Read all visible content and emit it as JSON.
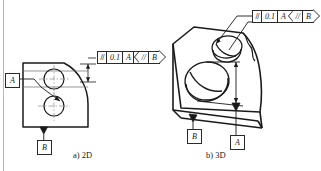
{
  "figure": {
    "ink_color": "#1a1a1a",
    "paper_color": "#ffffff",
    "border_color": "#b8b8b8"
  },
  "captions": {
    "left": "a) 2D",
    "right": "b) 3D"
  },
  "fcf_2d": {
    "symbol": "//",
    "tolerance": "0.1",
    "datum": "A"
  },
  "dtf_2d": {
    "symbol": "//",
    "datum": "B"
  },
  "fcf_3d": {
    "symbol": "//",
    "tolerance": "0.1",
    "datum": "A"
  },
  "dtf_3d": {
    "symbol": "//",
    "datum": "B"
  },
  "datums_2d": {
    "a": "A",
    "b": "B"
  },
  "datums_3d": {
    "a": "A",
    "b": "B"
  },
  "icons": {
    "parallelism": "parallelism-symbol-icon",
    "datum_triangle": "filled-datum-triangle-icon",
    "arrow_head": "dimension-arrowhead-icon"
  }
}
